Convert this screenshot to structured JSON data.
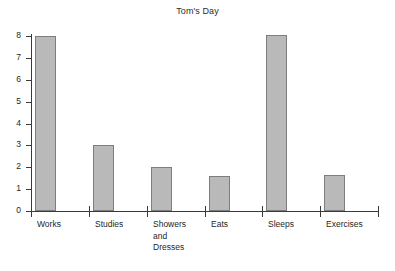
{
  "chart": {
    "title": "Tom's Day"
  },
  "axes": {
    "y_ticks": [
      "0",
      "1",
      "2",
      "3",
      "4",
      "5",
      "6",
      "7",
      "8"
    ],
    "x_labels": [
      "Works",
      "Studies",
      "Showers\nand\nDresses",
      "Eats",
      "Sleeps",
      "Exercises"
    ]
  },
  "colors": {
    "bar_fill": "#b9b9b9",
    "bar_border": "#7d7d7d",
    "axis": "#3a3a3a",
    "background": "#ffffff",
    "text": "#1f1f1f"
  },
  "chart_data": {
    "type": "bar",
    "title": "Tom's Day",
    "xlabel": "",
    "ylabel": "",
    "categories": [
      "Works",
      "Studies",
      "Showers and Dresses",
      "Eats",
      "Sleeps",
      "Exercises"
    ],
    "values": [
      8,
      3,
      2,
      1.6,
      8.05,
      1.65
    ],
    "ylim": [
      0,
      8
    ],
    "yticks": [
      0,
      1,
      2,
      3,
      4,
      5,
      6,
      7,
      8
    ],
    "grid": false,
    "legend": null
  }
}
